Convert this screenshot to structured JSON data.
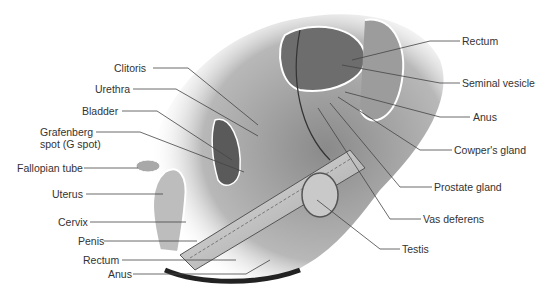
{
  "diagram": {
    "type": "anatomical-illustration",
    "left_labels": [
      {
        "id": "clitoris",
        "text": "Clitoris",
        "x": 114,
        "y": 67,
        "anchor": [
          188,
          68
        ],
        "target": [
          258,
          125
        ]
      },
      {
        "id": "urethra",
        "text": "Urethra",
        "x": 95,
        "y": 89,
        "anchor": [
          133,
          89
        ],
        "target": [
          258,
          136
        ]
      },
      {
        "id": "bladder",
        "text": "Bladder",
        "x": 82,
        "y": 110,
        "anchor": [
          122,
          111
        ],
        "target": [
          232,
          160
        ]
      },
      {
        "id": "grafenberg",
        "text": "Grafenberg",
        "x": 40,
        "y": 130,
        "anchor": [
          96,
          132
        ],
        "target": [
          244,
          172
        ]
      },
      {
        "id": "grafenberg2",
        "text": "spot (G spot)",
        "x": 40,
        "y": 142,
        "anchor": null,
        "target": null
      },
      {
        "id": "fallopian",
        "text": "Fallopian tube",
        "x": 17,
        "y": 162,
        "anchor": [
          84,
          168
        ],
        "target": [
          138,
          168
        ]
      },
      {
        "id": "uterus",
        "text": "Uterus",
        "x": 52,
        "y": 189,
        "anchor": [
          86,
          194
        ],
        "target": [
          163,
          194
        ]
      },
      {
        "id": "cervix",
        "text": "Cervix",
        "x": 58,
        "y": 221,
        "anchor": [
          90,
          222
        ],
        "target": [
          186,
          222
        ]
      },
      {
        "id": "penis",
        "text": "Penis",
        "x": 78,
        "y": 236,
        "anchor": [
          104,
          241
        ],
        "target": [
          197,
          241
        ]
      },
      {
        "id": "rectum_f",
        "text": "Rectum",
        "x": 83,
        "y": 255,
        "anchor": [
          122,
          260
        ],
        "target": [
          236,
          260
        ]
      },
      {
        "id": "anus_f",
        "text": "Anus",
        "x": 108,
        "y": 268,
        "anchor": [
          133,
          274
        ],
        "target": [
          246,
          274
        ]
      }
    ],
    "right_labels": [
      {
        "id": "rectum_m",
        "text": "Rectum",
        "x": 462,
        "y": 35,
        "anchor": [
          460,
          41
        ],
        "target": [
          352,
          60
        ]
      },
      {
        "id": "seminal",
        "text": "Seminal vesicle",
        "x": 462,
        "y": 77,
        "anchor": [
          460,
          83
        ],
        "target": [
          342,
          65
        ]
      },
      {
        "id": "anus_m",
        "text": "Anus",
        "x": 473,
        "y": 112,
        "anchor": [
          470,
          117
        ],
        "target": [
          345,
          92
        ]
      },
      {
        "id": "cowper",
        "text": "Cowper's gland",
        "x": 454,
        "y": 146,
        "anchor": [
          452,
          150
        ],
        "target": [
          338,
          97
        ]
      },
      {
        "id": "prostate",
        "text": "Prostate gland",
        "x": 434,
        "y": 182,
        "anchor": [
          432,
          187
        ],
        "target": [
          330,
          103
        ]
      },
      {
        "id": "vas",
        "text": "Vas deferens",
        "x": 423,
        "y": 213,
        "anchor": [
          421,
          219
        ],
        "target": [
          318,
          108
        ]
      },
      {
        "id": "testis",
        "text": "Testis",
        "x": 402,
        "y": 244,
        "anchor": [
          400,
          249
        ],
        "target": [
          317,
          200
        ]
      }
    ]
  }
}
